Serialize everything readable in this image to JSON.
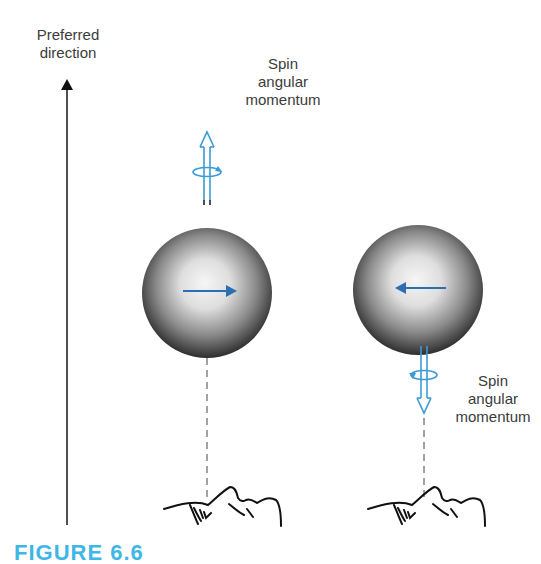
{
  "labels": {
    "preferred_direction": [
      "Preferred",
      "direction"
    ],
    "spin_up": [
      "Spin",
      "angular",
      "momentum"
    ],
    "spin_down": [
      "Spin",
      "angular",
      "momentum"
    ]
  },
  "caption": "FIGURE 6.6",
  "colors": {
    "accent_blue": "#3a9bd6",
    "arrow_blue": "#2b6fb0",
    "caption_blue": "#3fb6e6",
    "text": "#3b3b3b"
  },
  "spheres": [
    {
      "name": "left-sphere",
      "cx": 207,
      "cy": 293,
      "r": 64,
      "inner_arrow": "right",
      "spin": "up"
    },
    {
      "name": "right-sphere",
      "cx": 418,
      "cy": 290,
      "r": 64,
      "inner_arrow": "left",
      "spin": "down"
    }
  ]
}
